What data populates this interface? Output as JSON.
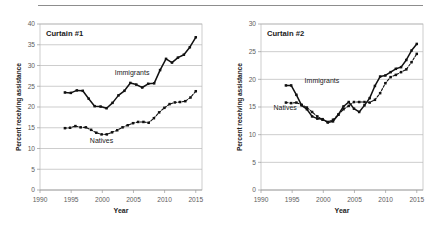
{
  "figure": {
    "divider": "horizontal-rule",
    "panel_count": 2
  },
  "chart_data": [
    {
      "type": "line",
      "title": "Curtain #1",
      "xlabel": "Year",
      "ylabel": "Percent receiving assistance",
      "xlim": [
        1990,
        2016
      ],
      "ylim": [
        0,
        40
      ],
      "xticks": [
        1990,
        1995,
        2000,
        2005,
        2010,
        2015
      ],
      "yticks": [
        0,
        5,
        10,
        15,
        20,
        25,
        30,
        35,
        40
      ],
      "grid": "horizontal",
      "legend": "inline-annotations",
      "x": [
        1994,
        1995,
        1996,
        1997,
        1998,
        1999,
        2000,
        2001,
        2002,
        2003,
        2004,
        2005,
        2006,
        2007,
        2008,
        2009,
        2010,
        2011,
        2012,
        2013,
        2014,
        2015
      ],
      "series": [
        {
          "name": "Immigrants",
          "style": "solid",
          "marker": "filled-square",
          "values": [
            23.5,
            23.4,
            24.0,
            23.9,
            22.0,
            20.2,
            20.1,
            19.7,
            21.0,
            22.8,
            23.9,
            25.8,
            25.4,
            24.7,
            25.6,
            25.7,
            28.9,
            31.6,
            30.7,
            31.9,
            32.6,
            34.4,
            36.8
          ]
        },
        {
          "name": "Natives",
          "style": "dashed",
          "marker": "filled-square",
          "values": [
            14.9,
            15.0,
            15.4,
            15.1,
            15.1,
            14.5,
            13.8,
            13.4,
            13.4,
            13.9,
            14.4,
            15.1,
            15.6,
            16.1,
            16.4,
            16.4,
            16.2,
            17.3,
            18.7,
            19.8,
            20.7,
            21.1,
            21.2,
            21.4,
            22.3,
            23.8
          ]
        }
      ],
      "annotations": [
        {
          "text": "Immigrants",
          "x": 2002,
          "y": 28.0
        },
        {
          "text": "Natives",
          "x": 1998,
          "y": 11.6
        }
      ]
    },
    {
      "type": "line",
      "title": "Curtain #2",
      "xlabel": "Year",
      "ylabel": "Percent receiving assistance",
      "xlim": [
        1990,
        2016
      ],
      "ylim": [
        0,
        30
      ],
      "xticks": [
        1990,
        1995,
        2000,
        2005,
        2010,
        2015
      ],
      "yticks": [
        0,
        5,
        10,
        15,
        20,
        25,
        30
      ],
      "grid": "horizontal",
      "legend": "inline-annotations",
      "x": [
        1994,
        1995,
        1996,
        1997,
        1998,
        1999,
        2000,
        2001,
        2002,
        2003,
        2004,
        2005,
        2006,
        2007,
        2008,
        2009,
        2010,
        2011,
        2012,
        2013,
        2014,
        2015
      ],
      "series": [
        {
          "name": "Immigrants",
          "style": "solid",
          "marker": "filled-square",
          "values": [
            18.9,
            18.9,
            17.2,
            15.3,
            14.6,
            13.3,
            12.9,
            12.8,
            12.2,
            12.4,
            13.6,
            15.1,
            15.9,
            14.7,
            14.1,
            15.3,
            16.6,
            18.8,
            20.5,
            20.7,
            21.3,
            21.9,
            22.2,
            23.5,
            25.2,
            26.4
          ]
        },
        {
          "name": "Natives",
          "style": "dashed",
          "marker": "filled-square",
          "values": [
            15.8,
            15.7,
            15.8,
            15.4,
            14.9,
            14.1,
            13.3,
            12.7,
            12.3,
            12.7,
            13.6,
            14.6,
            15.2,
            15.9,
            15.9,
            15.9,
            15.8,
            16.3,
            17.5,
            19.3,
            20.4,
            20.8,
            21.3,
            21.8,
            23.1,
            24.6
          ]
        }
      ],
      "annotations": [
        {
          "text": "Immigrants",
          "x": 1997,
          "y": 19.6
        },
        {
          "text": "Natives",
          "x": 1992,
          "y": 14.6
        }
      ]
    }
  ]
}
